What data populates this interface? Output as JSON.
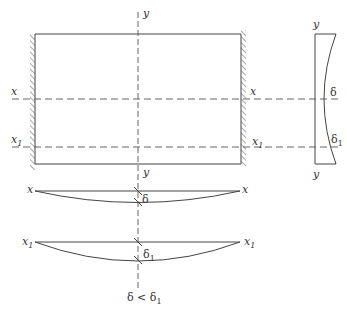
{
  "diagram": {
    "type": "plate-deflection",
    "plate": {
      "axis_labels": {
        "y_top": "y",
        "y_bottom": "y",
        "x_left": "x",
        "x_right": "x",
        "x1_left": "x",
        "x1_left_sub": "1",
        "x1_right": "x",
        "x1_right_sub": "1"
      },
      "supports": "clamped left and right edges (hatched)"
    },
    "side_view": {
      "y_top": "y",
      "y_bottom": "y",
      "delta": "δ",
      "delta1": "δ",
      "delta1_sub": "1"
    },
    "section_x": {
      "left_label": "x",
      "right_label": "x",
      "deflection": "δ"
    },
    "section_x1": {
      "left_label": "x",
      "left_sub": "1",
      "right_label": "x",
      "right_sub": "1",
      "deflection": "δ",
      "deflection_sub": "1"
    },
    "conclusion": {
      "text_a": "δ < δ",
      "text_sub": "1"
    },
    "colors": {
      "line": "#444444",
      "background": "#ffffff"
    }
  }
}
